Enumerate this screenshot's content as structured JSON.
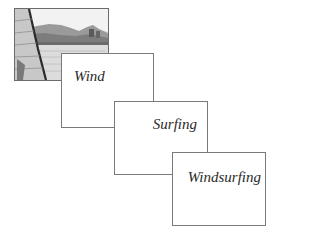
{
  "photo": {
    "alt": "windsurfing-photo",
    "description": "Grayscale photo of a windsurfer's sail on the left with a hilly shoreline and water"
  },
  "cards": [
    {
      "id": "wind",
      "label": "Wind"
    },
    {
      "id": "surfing",
      "label": "Surfing"
    },
    {
      "id": "windsurfing",
      "label": "Windsurfing"
    }
  ],
  "colors": {
    "border": "#7a7a7a",
    "text": "#2a2a2a",
    "background": "#ffffff"
  }
}
